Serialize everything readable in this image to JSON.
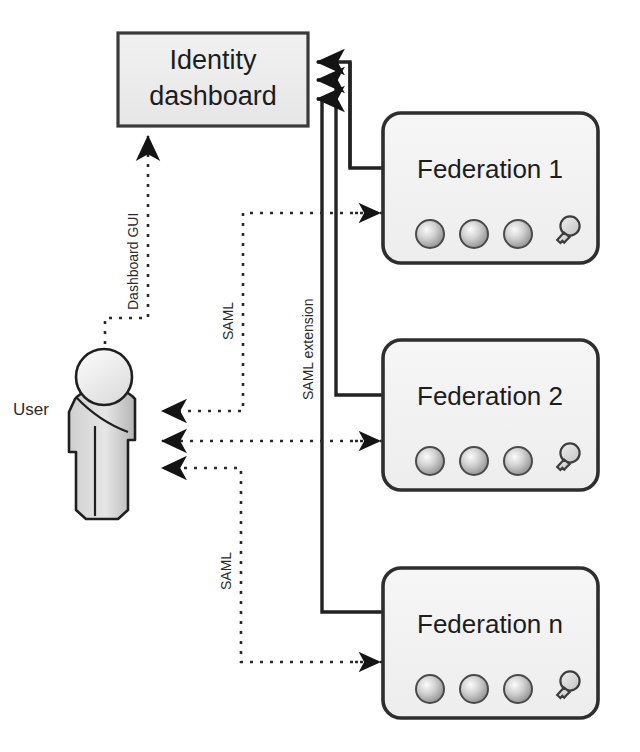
{
  "diagram": {
    "colors": {
      "box_fill": "#eeeeee",
      "box_stroke": "#3a3a3a",
      "round_box_fill": "#f2f2f2",
      "round_box_stroke": "#2e2e2e",
      "line_solid": "#222222",
      "line_dotted": "#2a2a2a",
      "text": "#1d1d1d",
      "person_fill_light": "#f3f3f3",
      "person_fill_mid": "#d8d8d8",
      "person_fill_dark": "#b9b9b9",
      "sphere_light": "#f0f0f0",
      "sphere_dark": "#9a9a9a",
      "key_fill": "#dcdcdc",
      "page_background": "#ffffff"
    },
    "nodes": {
      "dashboard": {
        "name": "identity-dashboard",
        "label_line1": "Identity",
        "label_line2": "dashboard",
        "shape": "rectangle",
        "x": 118,
        "y": 33,
        "width": 190,
        "height": 93
      },
      "user": {
        "name": "user-actor",
        "label": "User",
        "shape": "person",
        "x": 60,
        "y": 350,
        "width": 92,
        "height": 170
      },
      "federations": [
        {
          "name": "federation-1",
          "label": "Federation 1",
          "shape": "rounded-rectangle",
          "x": 383,
          "y": 113,
          "width": 215,
          "height": 150,
          "icons": [
            "sphere-icon",
            "sphere-icon",
            "sphere-icon",
            "key-icon"
          ]
        },
        {
          "name": "federation-2",
          "label": "Federation 2",
          "shape": "rounded-rectangle",
          "x": 383,
          "y": 340,
          "width": 215,
          "height": 150,
          "icons": [
            "sphere-icon",
            "sphere-icon",
            "sphere-icon",
            "key-icon"
          ]
        },
        {
          "name": "federation-n",
          "label": "Federation n",
          "shape": "rounded-rectangle",
          "x": 383,
          "y": 568,
          "width": 215,
          "height": 150,
          "icons": [
            "sphere-icon",
            "sphere-icon",
            "sphere-icon",
            "key-icon"
          ]
        }
      ]
    },
    "edge_labels": {
      "dashboard_gui": "Dashboard GUI",
      "saml_upper": "SAML",
      "saml_extension": "SAML extension",
      "saml_lower": "SAML"
    },
    "connections": [
      {
        "name": "federation-1-to-dashboard",
        "style": "solid",
        "from": "federation-1",
        "to": "identity-dashboard",
        "label": "SAML extension"
      },
      {
        "name": "federation-2-to-dashboard",
        "style": "solid",
        "from": "federation-2",
        "to": "identity-dashboard",
        "label": "SAML extension"
      },
      {
        "name": "federation-n-to-dashboard",
        "style": "solid",
        "from": "federation-n",
        "to": "identity-dashboard",
        "label": "SAML extension"
      },
      {
        "name": "user-to-dashboard-gui",
        "style": "dotted",
        "from": "user-actor",
        "to": "identity-dashboard",
        "label": "Dashboard GUI"
      },
      {
        "name": "user-to-federation-1",
        "style": "dotted",
        "from": "user-actor",
        "to": "federation-1",
        "label": "SAML"
      },
      {
        "name": "user-to-federation-2",
        "style": "dotted",
        "from": "user-actor",
        "to": "federation-2",
        "label": "SAML"
      },
      {
        "name": "user-to-federation-n",
        "style": "dotted",
        "from": "user-actor",
        "to": "federation-n",
        "label": "SAML"
      }
    ]
  }
}
